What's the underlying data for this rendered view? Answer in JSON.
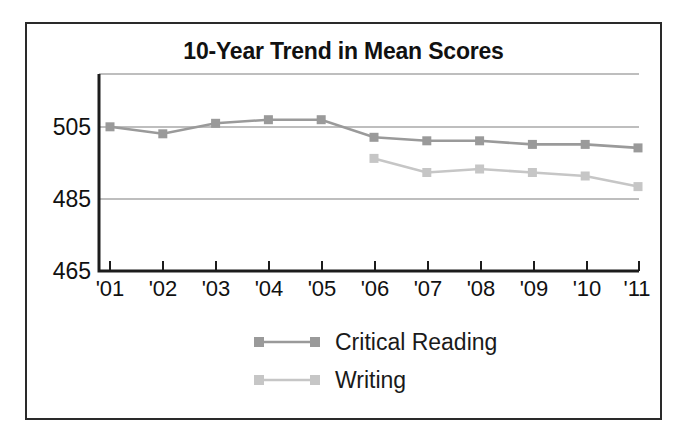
{
  "chart_data": {
    "type": "line",
    "title": "10-Year Trend in Mean Scores",
    "xlabel": "",
    "ylabel": "",
    "categories": [
      "'01",
      "'02",
      "'03",
      "'04",
      "'05",
      "'06",
      "'07",
      "'08",
      "'09",
      "'10",
      "'11"
    ],
    "ytick_labels": [
      "465",
      "485",
      "505"
    ],
    "yticks": [
      465,
      485,
      505
    ],
    "ylim": [
      465,
      521
    ],
    "grid": true,
    "gridlines": [
      485,
      505,
      521
    ],
    "legend_position": "bottom-center",
    "series": [
      {
        "name": "Critical Reading",
        "color": "#9a9a9a",
        "marker": "square",
        "values": [
          506,
          504,
          507,
          508,
          508,
          503,
          502,
          502,
          501,
          501,
          500
        ]
      },
      {
        "name": "Writing",
        "color": "#c6c6c6",
        "marker": "square",
        "values": [
          null,
          null,
          null,
          null,
          null,
          497,
          493,
          494,
          493,
          492,
          489
        ]
      }
    ]
  },
  "legend": {
    "items": [
      {
        "label": "Critical Reading",
        "color": "#9a9a9a"
      },
      {
        "label": "Writing",
        "color": "#c6c6c6"
      }
    ]
  },
  "colors": {
    "frame": "#2a2a2a",
    "axis": "#1c1c1c",
    "grid": "#a8a8a8",
    "critical_reading": "#9a9a9a",
    "writing": "#c6c6c6",
    "background": "#ffffff",
    "text": "#111111"
  }
}
